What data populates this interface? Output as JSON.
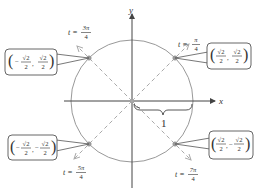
{
  "diagram": {
    "axes": {
      "x_label": "x",
      "y_label": "y"
    },
    "radius_label": "1",
    "colors": {
      "axis": "#444444",
      "circle": "#999999",
      "dashed": "#aaaaaa",
      "point": "#999999",
      "box_border": "#555555"
    },
    "points": [
      {
        "id": "q1",
        "t_label": "t = ",
        "t_num": "π",
        "t_den": "4",
        "coord": {
          "x_num": "√2",
          "x_den": "2",
          "y_num": "√2",
          "y_den": "2",
          "x_sign": "",
          "y_sign": ""
        }
      },
      {
        "id": "q2",
        "t_label": "t = ",
        "t_num": "3π",
        "t_den": "4",
        "coord": {
          "x_num": "√2",
          "x_den": "2",
          "y_num": "√2",
          "y_den": "2",
          "x_sign": "−",
          "y_sign": ""
        }
      },
      {
        "id": "q3",
        "t_label": "t = ",
        "t_num": "5π",
        "t_den": "4",
        "coord": {
          "x_num": "√2",
          "x_den": "2",
          "y_num": "√2",
          "y_den": "2",
          "x_sign": "−",
          "y_sign": "−"
        }
      },
      {
        "id": "q4",
        "t_label": "t = ",
        "t_num": "7π",
        "t_den": "4",
        "coord": {
          "x_num": "√2",
          "x_den": "2",
          "y_num": "√2",
          "y_den": "2",
          "x_sign": "",
          "y_sign": "−"
        }
      }
    ]
  }
}
